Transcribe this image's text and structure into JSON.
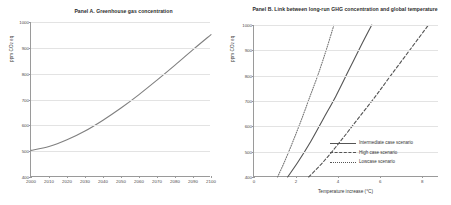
{
  "figure": {
    "panel_a": {
      "title": "Panel A. Greenhouse gas concentration",
      "ylabel": "ppm CO",
      "ylabel_sub": "2",
      "ylabel_tail": " eq"
    },
    "panel_b": {
      "title": "Panel B. Link between long-run GHG concentration and global temperature",
      "ylabel": "ppm CO",
      "ylabel_sub": "2",
      "ylabel_tail": " eq",
      "xlabel": "Temperature increase (°C)",
      "legend": [
        {
          "label": "Intermediate case scenario",
          "style": "solid"
        },
        {
          "label": "High case scenario",
          "style": "dashed"
        },
        {
          "label": "Lowcase scenario",
          "style": "dotted"
        }
      ]
    }
  },
  "chart_data": [
    {
      "id": "panel-a",
      "type": "line",
      "title": "Panel A. Greenhouse gas concentration",
      "xlabel": "",
      "ylabel": "ppm CO2 eq",
      "xlim": [
        2000,
        2100
      ],
      "ylim": [
        400,
        1000
      ],
      "xticks": [
        2000,
        2010,
        2020,
        2030,
        2040,
        2050,
        2060,
        2070,
        2080,
        2090,
        2100
      ],
      "yticks": [
        400,
        500,
        600,
        700,
        800,
        900,
        1000
      ],
      "grid": true,
      "legend_position": "none",
      "series": [
        {
          "name": "Greenhouse gas concentration",
          "style": "solid",
          "color": "#808080",
          "x": [
            2000,
            2010,
            2020,
            2030,
            2040,
            2050,
            2060,
            2070,
            2080,
            2090,
            2100
          ],
          "values": [
            503,
            518,
            544,
            578,
            620,
            667,
            719,
            775,
            833,
            893,
            951
          ]
        }
      ]
    },
    {
      "id": "panel-b",
      "type": "line",
      "title": "Panel B. Link between long-run GHG concentration and global temperature",
      "xlabel": "Temperature increase (°C)",
      "ylabel": "ppm CO2 eq",
      "xlim": [
        0,
        8.8
      ],
      "ylim": [
        400,
        1000
      ],
      "xticks": [
        0,
        2,
        4,
        6,
        8
      ],
      "yticks": [
        400,
        500,
        600,
        700,
        800,
        900,
        1000
      ],
      "grid": true,
      "legend_position": "lower-right",
      "series": [
        {
          "name": "Intermediate case scenario",
          "style": "solid",
          "color": "#555555",
          "x": [
            1.6,
            2.1,
            2.7,
            3.3,
            3.9,
            4.5,
            5.1,
            5.6
          ],
          "values": [
            400,
            460,
            540,
            630,
            720,
            820,
            920,
            1000
          ]
        },
        {
          "name": "High case scenario",
          "style": "dashed",
          "color": "#555555",
          "x": [
            2.6,
            3.3,
            4.1,
            4.9,
            5.7,
            6.5,
            7.4,
            8.3
          ],
          "values": [
            400,
            460,
            540,
            625,
            710,
            800,
            900,
            1000
          ]
        },
        {
          "name": "Lowcase scenario",
          "style": "dotted",
          "color": "#777777",
          "x": [
            1.12,
            1.45,
            1.85,
            2.25,
            2.65,
            3.05,
            3.45,
            3.8
          ],
          "values": [
            400,
            460,
            540,
            625,
            715,
            805,
            905,
            1000
          ]
        }
      ]
    }
  ]
}
